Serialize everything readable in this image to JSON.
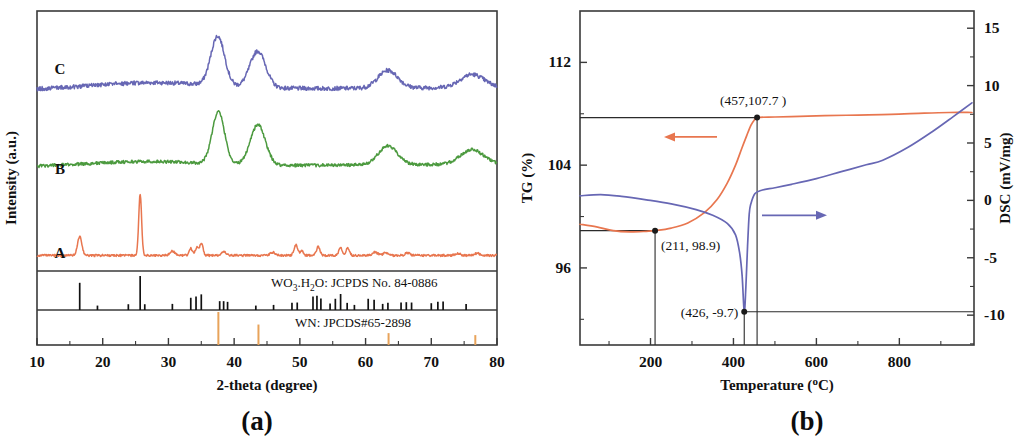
{
  "figure": {
    "panels": [
      {
        "id": "a",
        "letter": "(a)",
        "xlabel": "2-theta (degree)",
        "ylabel": "Intensity (a.u.)"
      },
      {
        "id": "b",
        "letter": "(b)",
        "xlabel_pre": "Temperature (",
        "xlabel_deg": "o",
        "xlabel_post": "C)",
        "ylabel_left": "TG (%)",
        "ylabel_right": "DSC (mV/mg)"
      }
    ]
  },
  "chart_data": [
    {
      "type": "line",
      "panel": "a",
      "title": "",
      "xlabel": "2-theta (degree)",
      "ylabel": "Intensity (a.u.)",
      "xlim": [
        10,
        80
      ],
      "xticks": [
        10,
        20,
        30,
        40,
        50,
        60,
        70,
        80
      ],
      "xtick_labels": [
        "10",
        "20",
        "30",
        "40",
        "50",
        "60",
        "70",
        "80"
      ],
      "yticks": [],
      "ytick_labels": [],
      "grid": false,
      "legend_position": "inline-curve-labels",
      "series": [
        {
          "name": "A",
          "label": "A",
          "color": "#e8764f",
          "baseline_offset": 0.06,
          "noise": 0.004,
          "peaks": [
            {
              "x": 16.5,
              "h": 0.072,
              "w": 0.33
            },
            {
              "x": 25.7,
              "h": 0.235,
              "w": 0.22
            },
            {
              "x": 30.6,
              "h": 0.017,
              "w": 0.38
            },
            {
              "x": 33.4,
              "h": 0.028,
              "w": 0.24
            },
            {
              "x": 34.3,
              "h": 0.03,
              "w": 0.22
            },
            {
              "x": 35.0,
              "h": 0.048,
              "w": 0.26
            },
            {
              "x": 38.4,
              "h": 0.013,
              "w": 0.35
            },
            {
              "x": 45.9,
              "h": 0.012,
              "w": 0.35
            },
            {
              "x": 49.4,
              "h": 0.04,
              "w": 0.28
            },
            {
              "x": 50.3,
              "h": 0.016,
              "w": 0.25
            },
            {
              "x": 52.8,
              "h": 0.034,
              "w": 0.26
            },
            {
              "x": 56.2,
              "h": 0.032,
              "w": 0.26
            },
            {
              "x": 57.3,
              "h": 0.029,
              "w": 0.26
            },
            {
              "x": 61.5,
              "h": 0.013,
              "w": 0.35
            },
            {
              "x": 63.0,
              "h": 0.01,
              "w": 0.35
            },
            {
              "x": 66.4,
              "h": 0.01,
              "w": 0.35
            },
            {
              "x": 74.0,
              "h": 0.008,
              "w": 0.4
            },
            {
              "x": 77.0,
              "h": 0.008,
              "w": 0.4
            }
          ]
        },
        {
          "name": "B",
          "label": "B",
          "color": "#4c9a3f",
          "baseline_offset": 0.4,
          "noise": 0.006,
          "hump": {
            "center": 26.0,
            "height": 0.02,
            "width": 9.0
          },
          "peaks": [
            {
              "x": 37.6,
              "h": 0.2,
              "w": 0.95
            },
            {
              "x": 43.6,
              "h": 0.155,
              "w": 1.15
            },
            {
              "x": 63.4,
              "h": 0.072,
              "w": 1.45
            },
            {
              "x": 76.2,
              "h": 0.056,
              "w": 1.7
            }
          ]
        },
        {
          "name": "C",
          "label": "C",
          "color": "#6767b4",
          "baseline_offset": 0.695,
          "noise": 0.008,
          "hump": {
            "center": 27.0,
            "height": 0.028,
            "width": 9.5
          },
          "peaks": [
            {
              "x": 37.5,
              "h": 0.19,
              "w": 1.05
            },
            {
              "x": 43.6,
              "h": 0.14,
              "w": 1.2
            },
            {
              "x": 63.4,
              "h": 0.068,
              "w": 1.5
            },
            {
              "x": 76.2,
              "h": 0.05,
              "w": 1.8
            }
          ]
        }
      ],
      "reference_patterns": [
        {
          "name": "WO3.H2O: JCPDS No. 84-0886",
          "label_parts": [
            {
              "t": "WO",
              "sub": false
            },
            {
              "t": "3",
              "sub": true
            },
            {
              "t": ".H",
              "sub": false
            },
            {
              "t": "2",
              "sub": true
            },
            {
              "t": "O: JCPDS No. 84-0886",
              "sub": false
            }
          ],
          "color": "#111111",
          "lines": [
            {
              "x": 16.5,
              "i": 0.8
            },
            {
              "x": 19.2,
              "i": 0.13
            },
            {
              "x": 23.9,
              "i": 0.17
            },
            {
              "x": 25.7,
              "i": 1.0
            },
            {
              "x": 26.4,
              "i": 0.17
            },
            {
              "x": 30.6,
              "i": 0.18
            },
            {
              "x": 33.4,
              "i": 0.36
            },
            {
              "x": 34.2,
              "i": 0.4
            },
            {
              "x": 35.0,
              "i": 0.46
            },
            {
              "x": 37.8,
              "i": 0.26
            },
            {
              "x": 38.4,
              "i": 0.26
            },
            {
              "x": 39.0,
              "i": 0.24
            },
            {
              "x": 43.3,
              "i": 0.13
            },
            {
              "x": 46.0,
              "i": 0.15
            },
            {
              "x": 48.8,
              "i": 0.21
            },
            {
              "x": 49.6,
              "i": 0.22
            },
            {
              "x": 52.0,
              "i": 0.4
            },
            {
              "x": 52.6,
              "i": 0.42
            },
            {
              "x": 53.2,
              "i": 0.34
            },
            {
              "x": 54.6,
              "i": 0.19
            },
            {
              "x": 55.4,
              "i": 0.33
            },
            {
              "x": 56.2,
              "i": 0.47
            },
            {
              "x": 57.2,
              "i": 0.21
            },
            {
              "x": 58.3,
              "i": 0.15
            },
            {
              "x": 60.4,
              "i": 0.33
            },
            {
              "x": 61.3,
              "i": 0.3
            },
            {
              "x": 62.6,
              "i": 0.18
            },
            {
              "x": 63.4,
              "i": 0.21
            },
            {
              "x": 65.4,
              "i": 0.22
            },
            {
              "x": 66.2,
              "i": 0.23
            },
            {
              "x": 67.0,
              "i": 0.22
            },
            {
              "x": 70.0,
              "i": 0.2
            },
            {
              "x": 71.0,
              "i": 0.24
            },
            {
              "x": 71.8,
              "i": 0.25
            },
            {
              "x": 75.3,
              "i": 0.18
            }
          ]
        },
        {
          "name": "WN: JPCDS#65-2898",
          "label": "WN: JPCDS#65-2898",
          "color": "#e8a35a",
          "lines": [
            {
              "x": 37.6,
              "i": 1.0
            },
            {
              "x": 43.7,
              "i": 0.62
            },
            {
              "x": 63.5,
              "i": 0.36
            },
            {
              "x": 76.7,
              "i": 0.3
            }
          ]
        }
      ]
    },
    {
      "type": "line",
      "panel": "b",
      "title": "",
      "xlabel": "Temperature (oC)",
      "ylabel_left": "TG (%)",
      "ylabel_right": "DSC (mV/mg)",
      "xlim": [
        30,
        980
      ],
      "xticks": [
        200,
        400,
        600,
        800
      ],
      "xtick_labels": [
        "200",
        "400",
        "600",
        "800"
      ],
      "ylim_left": [
        90,
        116
      ],
      "yticks_left": [
        96,
        104,
        112
      ],
      "ytick_labels_left": [
        "96",
        "104",
        "112"
      ],
      "ylim_right": [
        -12.6,
        16.5
      ],
      "yticks_right": [
        -10,
        -5,
        0,
        5,
        10,
        15
      ],
      "ytick_labels_right": [
        "-10",
        "-5",
        "0",
        "5",
        "10",
        "15"
      ],
      "grid": false,
      "series": [
        {
          "name": "TG",
          "axis": "left",
          "color": "#e8764f",
          "arrow": "left",
          "points": [
            [
              30,
              99.4
            ],
            [
              70,
              99.2
            ],
            [
              110,
              98.9
            ],
            [
              150,
              98.8
            ],
            [
              190,
              98.85
            ],
            [
              211,
              98.9
            ],
            [
              250,
              99.1
            ],
            [
              290,
              99.5
            ],
            [
              330,
              100.3
            ],
            [
              360,
              101.3
            ],
            [
              385,
              102.6
            ],
            [
              405,
              104.0
            ],
            [
              420,
              105.3
            ],
            [
              432,
              106.3
            ],
            [
              442,
              107.1
            ],
            [
              450,
              107.5
            ],
            [
              457,
              107.7
            ],
            [
              500,
              107.75
            ],
            [
              560,
              107.8
            ],
            [
              620,
              107.85
            ],
            [
              700,
              107.9
            ],
            [
              780,
              107.95
            ],
            [
              860,
              108.05
            ],
            [
              920,
              108.1
            ],
            [
              975,
              108.1
            ]
          ]
        },
        {
          "name": "DSC",
          "axis": "right",
          "color": "#6767b4",
          "arrow": "right",
          "points": [
            [
              30,
              0.4
            ],
            [
              80,
              0.5
            ],
            [
              130,
              0.35
            ],
            [
              190,
              0.05
            ],
            [
              250,
              -0.3
            ],
            [
              310,
              -0.8
            ],
            [
              350,
              -1.3
            ],
            [
              385,
              -2.0
            ],
            [
              405,
              -3.0
            ],
            [
              415,
              -4.6
            ],
            [
              421,
              -6.6
            ],
            [
              426,
              -9.7
            ],
            [
              430,
              -7.5
            ],
            [
              434,
              -4.0
            ],
            [
              438,
              -1.2
            ],
            [
              442,
              -0.3
            ],
            [
              452,
              0.6
            ],
            [
              470,
              0.9
            ],
            [
              500,
              1.1
            ],
            [
              540,
              1.4
            ],
            [
              600,
              1.9
            ],
            [
              660,
              2.5
            ],
            [
              720,
              3.1
            ],
            [
              760,
              3.5
            ],
            [
              820,
              4.6
            ],
            [
              880,
              6.0
            ],
            [
              930,
              7.3
            ],
            [
              975,
              8.5
            ]
          ]
        }
      ],
      "annotations": [
        {
          "text": "(457,107.7 )",
          "x": 457,
          "y_left": 107.7,
          "series": "TG"
        },
        {
          "text": "(211, 98.9)",
          "x": 211,
          "y_left": 98.9,
          "series": "TG"
        },
        {
          "text": "(426, -9.7)",
          "x": 426,
          "y_right": -9.7,
          "series": "DSC"
        }
      ]
    }
  ]
}
